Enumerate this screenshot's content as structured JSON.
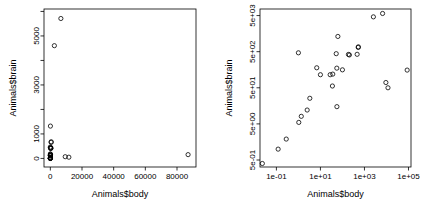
{
  "figure": {
    "background": "#ffffff",
    "point_color": "#000000",
    "point_shape": "open-circle"
  },
  "chart_data": [
    {
      "type": "scatter",
      "panel": "left",
      "title": "",
      "xlabel": "Animals$body",
      "ylabel": "Animals$brain",
      "xscale": "linear",
      "yscale": "linear",
      "xlim": [
        -4000,
        92000
      ],
      "ylim": [
        -350,
        6100
      ],
      "xticks": [
        0,
        20000,
        40000,
        60000,
        80000
      ],
      "xtick_labels": [
        "0",
        "20000",
        "40000",
        "60000",
        "80000"
      ],
      "yticks": [
        0,
        1000,
        3000,
        5000
      ],
      "ytick_labels": [
        "0",
        "1000",
        "3000",
        "5000"
      ],
      "yminor_ticks": [
        2000,
        4000,
        6000
      ],
      "grid": false,
      "legend": null,
      "x": [
        1.35,
        465,
        36.33,
        27.66,
        1.04,
        11700,
        2547,
        187.1,
        521,
        10,
        3.3,
        529,
        207,
        62,
        6654,
        9400,
        6.8,
        35,
        0.12,
        0.023,
        2.5,
        55.5,
        100,
        52.16,
        87000,
        0.28,
        56,
        1
      ],
      "y": [
        8.1,
        423,
        119.5,
        115,
        5.5,
        50,
        4603,
        419,
        655,
        115,
        25.6,
        680,
        406,
        1320,
        5712,
        70,
        179,
        56,
        1,
        0.4,
        12.1,
        175,
        157,
        440,
        154.5,
        1.9,
        15,
        465
      ],
      "point_labels": [
        "Mountain beaver",
        "Cow",
        "Grey wolf",
        "Goat",
        "Guinea pig",
        "Dipliodocus",
        "Asian elephant",
        "Donkey",
        "Horse",
        "Potar monkey",
        "Cat",
        "Giraffe",
        "Gorilla",
        "Human",
        "African elephant",
        "Triceratops",
        "Rhesus monkey",
        "Kangaroo",
        "Golden hamster",
        "Mouse",
        "Rabbit",
        "Sheep",
        "Jaguar",
        "Chimpanzee",
        "Brachiosaurus",
        "Rat",
        "Brazilian tapir",
        "Mole"
      ]
    },
    {
      "type": "scatter",
      "panel": "right",
      "title": "",
      "xlabel": "Animals$body",
      "ylabel": "Animals$brain",
      "xscale": "log",
      "yscale": "log",
      "xlim": [
        0.018,
        130000
      ],
      "ylim": [
        0.32,
        7600
      ],
      "xticks": [
        0.1,
        10,
        1000,
        100000
      ],
      "xtick_labels": [
        "1e-01",
        "1e+01",
        "1e+03",
        "1e+05"
      ],
      "yticks": [
        0.5,
        5,
        50,
        500,
        5000
      ],
      "ytick_labels": [
        "5e-01",
        "5e+00",
        "5e+01",
        "5e+02",
        "5e+03"
      ],
      "grid": false,
      "legend": null,
      "x": [
        1.35,
        465,
        36.33,
        27.66,
        1.04,
        11700,
        2547,
        187.1,
        521,
        10,
        3.3,
        529,
        207,
        62,
        6654,
        9400,
        6.8,
        35,
        0.12,
        0.023,
        2.5,
        55.5,
        100,
        52.16,
        87000,
        0.28,
        56,
        1
      ],
      "y": [
        8.1,
        423,
        119.5,
        115,
        5.5,
        50,
        4603,
        419,
        655,
        115,
        25.6,
        680,
        406,
        1320,
        5712,
        70,
        179,
        56,
        1,
        0.4,
        12.1,
        175,
        157,
        440,
        154.5,
        1.9,
        15,
        465
      ],
      "point_labels": [
        "Mountain beaver",
        "Cow",
        "Grey wolf",
        "Goat",
        "Guinea pig",
        "Dipliodocus",
        "Asian elephant",
        "Donkey",
        "Horse",
        "Potar monkey",
        "Cat",
        "Giraffe",
        "Gorilla",
        "Human",
        "African elephant",
        "Triceratops",
        "Rhesus monkey",
        "Kangaroo",
        "Golden hamster",
        "Mouse",
        "Rabbit",
        "Sheep",
        "Jaguar",
        "Chimpanzee",
        "Brachiosaurus",
        "Rat",
        "Brazilian tapir",
        "Mole"
      ]
    }
  ]
}
